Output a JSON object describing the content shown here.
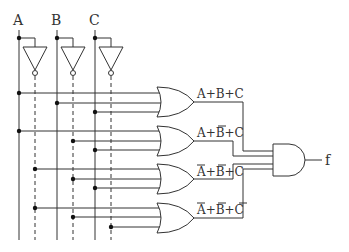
{
  "diagram": {
    "type": "logic-circuit",
    "inputs": [
      {
        "label": "A",
        "x": 19
      },
      {
        "label": "B",
        "x": 57
      },
      {
        "label": "C",
        "x": 95
      }
    ],
    "inverters": [
      {
        "input": "A",
        "output_x": 35
      },
      {
        "input": "B",
        "output_x": 73
      },
      {
        "input": "C",
        "output_x": 111
      }
    ],
    "or_gates": [
      {
        "id": "or1",
        "label": "A+B+C",
        "label_parts": [
          {
            "t": "A",
            "bar": false
          },
          {
            "t": "+"
          },
          {
            "t": "B",
            "bar": false
          },
          {
            "t": "+"
          },
          {
            "t": "C",
            "bar": false
          }
        ],
        "inputs": [
          "A",
          "B",
          "C"
        ]
      },
      {
        "id": "or2",
        "label": "A+B̄+C",
        "label_parts": [
          {
            "t": "A",
            "bar": false
          },
          {
            "t": "+"
          },
          {
            "t": "B",
            "bar": true
          },
          {
            "t": "+"
          },
          {
            "t": "C",
            "bar": false
          }
        ],
        "inputs": [
          "A",
          "B̄",
          "C"
        ]
      },
      {
        "id": "or3",
        "label": "Ā+B̄+C",
        "label_parts": [
          {
            "t": "A",
            "bar": true
          },
          {
            "t": "+"
          },
          {
            "t": "B",
            "bar": true
          },
          {
            "t": "+"
          },
          {
            "t": "C",
            "bar": false
          }
        ],
        "inputs": [
          "Ā",
          "B̄",
          "C"
        ]
      },
      {
        "id": "or4",
        "label": "Ā+B̄+C̄",
        "label_parts": [
          {
            "t": "A",
            "bar": true
          },
          {
            "t": "+"
          },
          {
            "t": "B",
            "bar": true
          },
          {
            "t": "+"
          },
          {
            "t": "C",
            "bar": true
          }
        ],
        "inputs": [
          "Ā",
          "B̄",
          "C̄"
        ]
      }
    ],
    "and_gate": {
      "id": "and1",
      "inputs": [
        "or1",
        "or2",
        "or3",
        "or4"
      ]
    },
    "output": {
      "label": "f"
    },
    "colors": {
      "line": "#333333",
      "dot": "#111111",
      "background": "#ffffff"
    }
  }
}
